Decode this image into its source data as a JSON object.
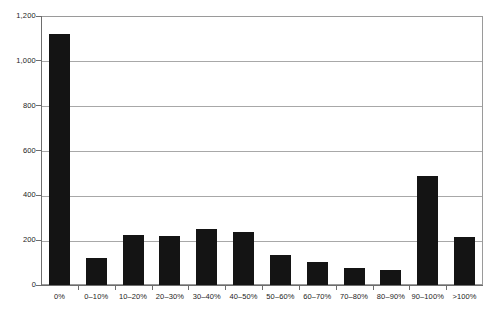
{
  "chart_data": {
    "type": "bar",
    "title": "",
    "subtitle": "",
    "xlabel": "",
    "ylabel": "",
    "categories": [
      "0%",
      "0–10%",
      "10–20%",
      "20–30%",
      "30–40%",
      "40–50%",
      "50–60%",
      "60–70%",
      "70–80%",
      "80–90%",
      "90–100%",
      ">100%"
    ],
    "values": [
      1120,
      120,
      222,
      218,
      250,
      237,
      133,
      102,
      75,
      67,
      485,
      213
    ],
    "ylim": [
      0,
      1200
    ],
    "y_ticks": [
      0,
      200,
      400,
      600,
      800,
      1000,
      1200
    ],
    "y_tick_labels": [
      "0",
      "200",
      "400",
      "600",
      "800",
      "1,000",
      "1,200"
    ],
    "grid": true,
    "legend": false,
    "legend_position": "none",
    "bar_color": "#141414",
    "grid_color": "#a8a8a8",
    "axis_color": "#6d6d6d",
    "background": "#ffffff"
  }
}
